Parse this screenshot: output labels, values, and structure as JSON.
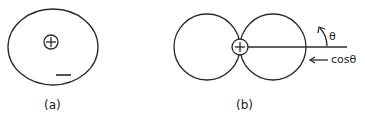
{
  "figure": {
    "panels": [
      {
        "id": "a",
        "label": "(a)",
        "description": "Ellipse enclosing a positive charge with a negative sign below-right",
        "positive_symbol": "+",
        "negative_symbol": "—"
      },
      {
        "id": "b",
        "label": "(b)",
        "description": "Two tangent circles (dipole / cosθ pattern) with a positive charge at the tangent point",
        "positive_symbol": "+",
        "angle_label": "θ",
        "arrow_label": "cosθ",
        "arrow_glyph": "←"
      }
    ],
    "colors": {
      "stroke": "#2a2a2a",
      "background": "#ffffff"
    }
  }
}
